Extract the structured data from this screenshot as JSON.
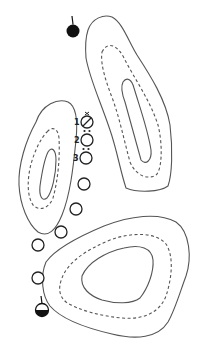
{
  "diagram": {
    "width": 200,
    "height": 348,
    "colors": {
      "background": "#ffffff",
      "contour": "#555555",
      "marker": "#111111"
    },
    "islands": [
      {
        "name": "island-top-right",
        "contours": [
          {
            "style": "solid",
            "d": "M88,30 C92,18 104,14 112,17 C122,22 128,40 137,55 C150,75 166,100 170,125 C173,150 172,175 168,186 C160,192 138,193 126,188 C120,170 117,150 110,130 C100,100 90,80 86,58 C85,45 86,36 88,30 Z"
          },
          {
            "style": "dashed",
            "d": "M102,52 C108,40 118,46 124,58 C134,78 150,100 158,125 C163,145 162,170 156,175 C148,180 136,176 130,162 C124,140 120,120 113,100 C106,82 100,64 102,52 Z"
          },
          {
            "style": "solid",
            "d": "M123,82 C127,76 132,80 134,88 C140,108 148,130 151,150 C152,160 146,166 141,160 C136,142 130,120 125,102 C122,94 121,86 123,82 Z"
          }
        ]
      },
      {
        "name": "island-middle-left",
        "contours": [
          {
            "style": "solid",
            "d": "M36,122 C42,104 58,98 68,102 C76,106 78,120 76,140 C73,170 70,195 62,215 C56,230 48,238 38,232 C28,224 20,205 19,185 C18,165 26,140 36,122 Z"
          },
          {
            "style": "dashed",
            "d": "M47,132 C52,126 58,128 59,138 C60,158 58,180 53,198 C49,208 40,212 33,205 C27,196 27,180 31,164 C35,150 41,138 47,132 Z"
          },
          {
            "style": "solid",
            "d": "M48,152 C52,146 56,150 56,160 C56,175 52,192 47,198 C42,202 39,196 40,186 C42,172 44,160 48,152 Z"
          }
        ]
      },
      {
        "name": "island-bottom-right",
        "contours": [
          {
            "style": "solid",
            "d": "M46,262 C56,248 80,236 104,226 C130,216 158,212 176,222 C190,232 192,258 186,276 C180,292 175,310 168,322 C158,338 136,340 112,334 C86,328 62,320 50,306 C42,296 40,276 46,262 Z"
          },
          {
            "style": "dashed",
            "d": "M62,278 C68,262 86,250 110,240 C132,232 156,232 166,244 C174,256 172,278 166,296 C160,312 144,320 122,318 C100,316 78,310 66,302 C59,296 58,288 62,278 Z"
          },
          {
            "style": "solid",
            "d": "M82,276 C88,262 106,252 124,248 C140,244 152,248 153,260 C154,272 148,288 140,298 C132,304 116,304 102,300 C90,296 80,288 82,276 Z"
          }
        ]
      }
    ],
    "markers": {
      "start": {
        "name": "start-marker-filled",
        "cx": 73,
        "cy": 31,
        "r": 6.5,
        "stem_top": 16,
        "fill": "full"
      },
      "finish": {
        "name": "finish-marker-half",
        "cx": 42,
        "cy": 310,
        "r": 6.5,
        "stem_top": 296,
        "fill": "bottom-half"
      }
    },
    "positions": [
      {
        "label": "1",
        "cx": 87,
        "cy": 122,
        "r": 6,
        "accent": "cross",
        "label_x": 74,
        "label_y": 125
      },
      {
        "label": "2",
        "cx": 87,
        "cy": 140,
        "r": 6,
        "accent": "dots",
        "label_x": 74,
        "label_y": 143
      },
      {
        "label": "3",
        "cx": 86,
        "cy": 158,
        "r": 6,
        "accent": "dots",
        "label_x": 73,
        "label_y": 161
      },
      {
        "label": "",
        "cx": 84,
        "cy": 184,
        "r": 6,
        "accent": "none"
      },
      {
        "label": "",
        "cx": 76,
        "cy": 209,
        "r": 6,
        "accent": "none"
      },
      {
        "label": "",
        "cx": 61,
        "cy": 232,
        "r": 6,
        "accent": "none"
      },
      {
        "label": "",
        "cx": 38,
        "cy": 245,
        "r": 6,
        "accent": "none"
      },
      {
        "label": "",
        "cx": 38,
        "cy": 278,
        "r": 6,
        "accent": "none"
      }
    ]
  }
}
